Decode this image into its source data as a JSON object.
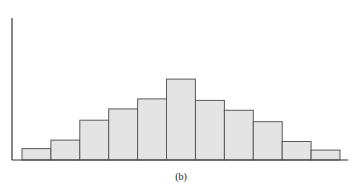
{
  "chart_data": {
    "type": "bar",
    "title": "",
    "caption": "(b)",
    "xlabel": "",
    "ylabel": "",
    "categories": [
      "1",
      "2",
      "3",
      "4",
      "5",
      "6",
      "7",
      "8",
      "9",
      "10",
      "11"
    ],
    "values": [
      8,
      14,
      28,
      36,
      43,
      57,
      42,
      35,
      27,
      13,
      7
    ],
    "ylim": [
      0,
      100
    ],
    "grid": false,
    "legend": "none",
    "bar_gap": 0,
    "colors": {
      "bar_fill": "#e4e4e4",
      "bar_stroke": "#5a5a5a",
      "axis": "#333333"
    }
  }
}
